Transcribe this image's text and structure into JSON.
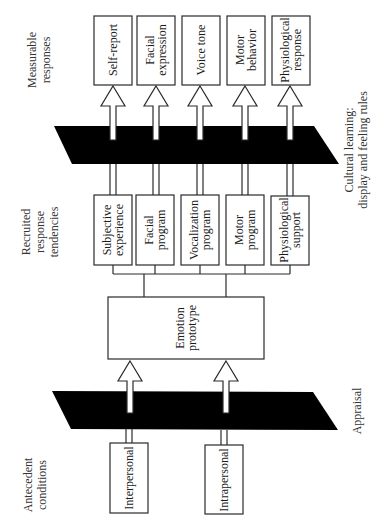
{
  "diagram": {
    "row_labels": {
      "measurable": [
        "Measurable",
        "responses"
      ],
      "recruited": [
        "Recruited",
        "response",
        "tendencies"
      ],
      "antecedent": [
        "Antecedent",
        "conditions"
      ]
    },
    "bands": {
      "cultural": [
        "Cultural learning:",
        "display and feeling rules"
      ],
      "appraisal": [
        "Appraisal"
      ]
    },
    "measurable_responses": [
      {
        "lines": [
          "Self-report"
        ]
      },
      {
        "lines": [
          "Facial",
          "expression"
        ]
      },
      {
        "lines": [
          "Voice tone"
        ]
      },
      {
        "lines": [
          "Motor",
          "behavior"
        ]
      },
      {
        "lines": [
          "Physiological",
          "response"
        ]
      }
    ],
    "response_tendencies": [
      {
        "lines": [
          "Subjective",
          "experience"
        ]
      },
      {
        "lines": [
          "Facial",
          "program"
        ]
      },
      {
        "lines": [
          "Vocalization",
          "program"
        ]
      },
      {
        "lines": [
          "Motor",
          "program"
        ]
      },
      {
        "lines": [
          "Physiological",
          "support"
        ]
      }
    ],
    "core": {
      "lines": [
        "Emotion",
        "prototype"
      ]
    },
    "antecedents": [
      {
        "lines": [
          "Interpersonal"
        ]
      },
      {
        "lines": [
          "Intrapersonal"
        ]
      }
    ]
  },
  "colors": {
    "band": "#000000",
    "stroke": "#2a2a2a",
    "background": "#ffffff"
  }
}
